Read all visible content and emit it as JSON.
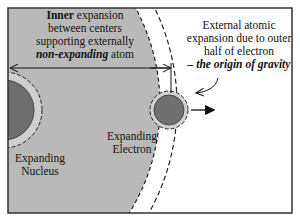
{
  "diagram": {
    "colors": {
      "atom_fill": "#b9b9b9",
      "nucleus_fill": "#6e6e6e",
      "electron_fill": "#707070",
      "halo_fill": "#d0d0d0",
      "frame": "#333333",
      "background": "#ffffff"
    },
    "inner_label": {
      "line1_bold": "Inner",
      "line1_rest": " expansion",
      "line2": "between centers",
      "line3": "supporting externally",
      "line4_bold_italic": "non-expanding",
      "line4_rest": " atom"
    },
    "external_label": {
      "line1": "External atomic",
      "line2": "expansion due to outer",
      "line3": "half of electron",
      "line4_bold_italic": "– the origin of gravity"
    },
    "nucleus_label": {
      "line1": "Expanding",
      "line2": "Nucleus"
    },
    "electron_label": {
      "line1": "Expanding",
      "line2": "Electron"
    }
  }
}
